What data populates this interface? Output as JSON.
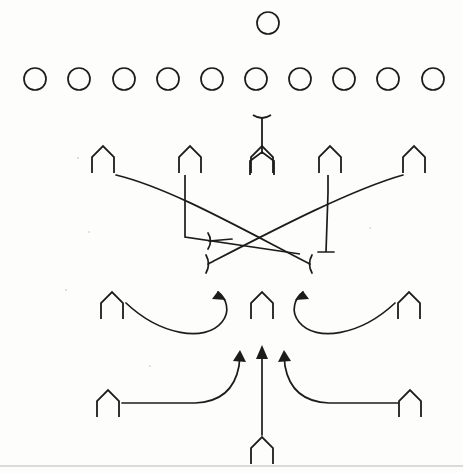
{
  "diagram": {
    "type": "american-football-play",
    "background_color": "#fdfdfb",
    "ink_color": "#1c1c1c",
    "rule_color": "#b9b9b9",
    "width": 463,
    "height": 473
  },
  "defense": {
    "label": "Defensive alignment",
    "deep_safety": {
      "name": "deep-safety",
      "cx": 268,
      "cy": 23,
      "r": 11
    },
    "front_row": {
      "name": "defensive-front-row",
      "count": 10,
      "cy": 79,
      "r": 11,
      "cx": [
        35,
        79,
        124,
        168,
        212,
        256,
        300,
        344,
        388,
        433
      ]
    }
  },
  "offense": {
    "label": "Offensive alignment",
    "line_row": {
      "name": "offensive-line-row",
      "y": 146,
      "players": [
        {
          "name": "left-tackle",
          "x": 103
        },
        {
          "name": "left-guard",
          "x": 190
        },
        {
          "name": "center",
          "x": 262
        },
        {
          "name": "right-guard",
          "x": 330
        },
        {
          "name": "right-tackle",
          "x": 414
        }
      ]
    },
    "quarterback": {
      "name": "quarterback",
      "x": 262,
      "y": 115,
      "stem_top": 117
    },
    "slot_row": {
      "name": "slot-receiver-row",
      "y": 292,
      "players": [
        {
          "name": "left-slot",
          "x": 112
        },
        {
          "name": "middle-back",
          "x": 262
        },
        {
          "name": "right-slot",
          "x": 409
        }
      ]
    },
    "wide_row": {
      "name": "wide-receiver-row",
      "y": 390,
      "players": [
        {
          "name": "left-wideout",
          "x": 108
        },
        {
          "name": "right-wideout",
          "x": 410
        }
      ]
    },
    "deep_back": {
      "name": "deep-back",
      "x": 262,
      "y": 437,
      "stem_top": 348
    }
  },
  "routes": {
    "label": "Route and block assignments",
    "paths": [
      {
        "name": "left-tackle-crossing-route",
        "end_mark": "tick",
        "direction": "down-right"
      },
      {
        "name": "right-tackle-crossing-route",
        "end_mark": "tick",
        "direction": "down-left"
      },
      {
        "name": "left-guard-block",
        "end_mark": "none",
        "direction": "down-right"
      },
      {
        "name": "right-guard-block",
        "end_mark": "tick",
        "direction": "down-left"
      },
      {
        "name": "left-slot-hook-route",
        "end_mark": "arrow",
        "direction": "curl-up"
      },
      {
        "name": "right-slot-hook-route",
        "end_mark": "arrow",
        "direction": "curl-up"
      },
      {
        "name": "left-wideout-drag-route",
        "end_mark": "arrow",
        "direction": "in-and-up"
      },
      {
        "name": "right-wideout-drag-route",
        "end_mark": "arrow",
        "direction": "in-and-up"
      },
      {
        "name": "deep-back-dive-route",
        "end_mark": "arrow",
        "direction": "straight-up"
      }
    ]
  },
  "page": {
    "bottom_rule": {
      "name": "page-bottom-rule",
      "y": 466
    }
  }
}
